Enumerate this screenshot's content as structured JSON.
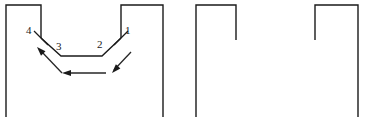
{
  "figure": {
    "type": "engineering-cross-section-diagram",
    "background_color": "#ffffff",
    "line_color": "#1a1a1a",
    "arrow_color": "#262626"
  },
  "labels": [
    {
      "id": "label-4",
      "text": "4",
      "x": 26,
      "y": 34
    },
    {
      "id": "label-3",
      "text": "3",
      "x": 56,
      "y": 50
    },
    {
      "id": "label-2",
      "text": "2",
      "x": 97,
      "y": 48
    },
    {
      "id": "label-1",
      "text": "1",
      "x": 125,
      "y": 34
    }
  ],
  "shapes": {
    "die_left_block": {
      "name": "left-die-block",
      "path": "M 6,117 L 6,5 L 41,5 L 41,38"
    },
    "die_right_block": {
      "name": "right-die-block",
      "path": "M 121,38 L 121,5 L 163,5 L 163,117"
    },
    "v_channel": {
      "name": "v-channel-profile",
      "path": "M 41,38 L 61,56 L 102,56 L 121,38"
    },
    "second_block": {
      "name": "second-die-block",
      "path": "M 196,117 L 196,5 L 236,5 L 236,40"
    },
    "third_block": {
      "name": "third-die-block",
      "path": "M 315,40 L 315,5 L 358,5 L 358,117"
    }
  },
  "tick_marks": [
    {
      "id": "tick-point-4",
      "x1": 34,
      "y1": 31,
      "x2": 48,
      "y2": 45
    },
    {
      "id": "tick-point-1",
      "x1": 114,
      "y1": 45,
      "x2": 128,
      "y2": 31
    }
  ],
  "flow_arrows": [
    {
      "id": "arrow-inflow-right",
      "description": "diagonal arrow entering from upper right toward channel bottom",
      "x1": 131,
      "y1": 52,
      "x2": 114,
      "y2": 70,
      "head_x": 112,
      "head_y": 73,
      "head_angle": 133
    },
    {
      "id": "arrow-bottom-horizontal",
      "description": "horizontal arrow flowing right to left beneath channel",
      "x1": 106,
      "y1": 73,
      "x2": 66,
      "y2": 73,
      "head_x": 62,
      "head_y": 73,
      "head_angle": 180
    },
    {
      "id": "arrow-outflow-left",
      "description": "diagonal arrow exiting toward upper left",
      "x1": 62,
      "y1": 73,
      "x2": 41,
      "y2": 51,
      "head_x": 37,
      "head_y": 47,
      "head_angle": 226
    }
  ]
}
